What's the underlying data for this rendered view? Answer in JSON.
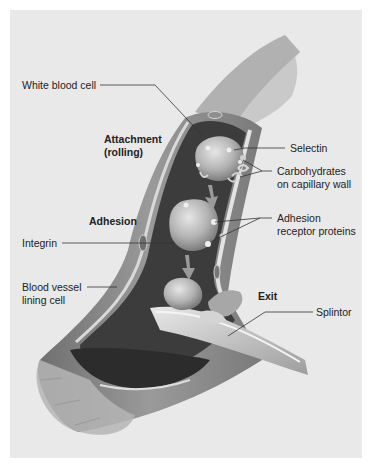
{
  "figure": {
    "type": "labeled-illustration",
    "colors": {
      "background": "#e9e9e9",
      "border": "#ffffff",
      "vessel_wall": "#8c8c8c",
      "vessel_lumen": "#3e3e3e",
      "lining": "#d8d8d8",
      "cell": "#b9b9b9",
      "leader_line": "#333333",
      "text": "#222222"
    }
  },
  "stages": {
    "attachment": "Attachment",
    "attachment_sub": "(rolling)",
    "adhesion": "Adhesion",
    "exit": "Exit"
  },
  "labels": {
    "white_blood_cell": "White blood cell",
    "selectin": "Selectin",
    "carbohydrates_1": "Carbohydrates",
    "carbohydrates_2": "on capillary wall",
    "adhesion_receptor_1": "Adhesion",
    "adhesion_receptor_2": "receptor proteins",
    "integrin": "Integrin",
    "lining_cell_1": "Blood vessel",
    "lining_cell_2": "lining cell",
    "splintor": "Splintor"
  }
}
